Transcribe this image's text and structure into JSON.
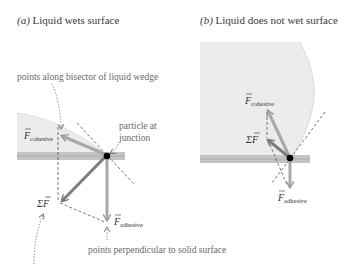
{
  "panels": [
    {
      "id": "a",
      "title_letter": "(a)",
      "title_text": " Liquid wets surface",
      "labels": {
        "cohesive": "F",
        "cohesive_sub": "cohesive",
        "adhesive": "F",
        "adhesive_sub": "adhesive",
        "sum": "ΣF",
        "particle": "particle at",
        "particle_2": "junction"
      },
      "annotations": {
        "bisector": "points along bisector of liquid wedge",
        "perpendicular": "points perpendicular to solid surface"
      }
    },
    {
      "id": "b",
      "title_letter": "(b)",
      "title_text": " Liquid does not wet surface",
      "labels": {
        "cohesive": "F",
        "cohesive_sub": "cohesive",
        "adhesive": "F",
        "adhesive_sub": "adhesive",
        "sum": "ΣF"
      }
    }
  ],
  "colors": {
    "liquid": "#ececec",
    "solid": "#b9b9b9",
    "arrow": "#9a9a9a",
    "arrow_dark": "#7d7d7d",
    "particle": "#000000",
    "dashed": "#555555"
  }
}
